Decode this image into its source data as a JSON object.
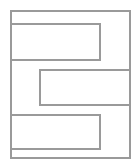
{
  "diagram": {
    "stroke_color": "#9a9a9a",
    "background": "#ffffff",
    "stroke_width": 2,
    "outer": {
      "x": 11,
      "y": 11,
      "w": 119,
      "h": 147
    },
    "blocks": [
      {
        "name": "top-left-block",
        "x": 11,
        "y": 24,
        "w": 89,
        "h": 36
      },
      {
        "name": "middle-right-block",
        "x": 40,
        "y": 70,
        "w": 90,
        "h": 35
      },
      {
        "name": "bottom-left-block",
        "x": 11,
        "y": 115,
        "w": 89,
        "h": 34
      }
    ]
  }
}
